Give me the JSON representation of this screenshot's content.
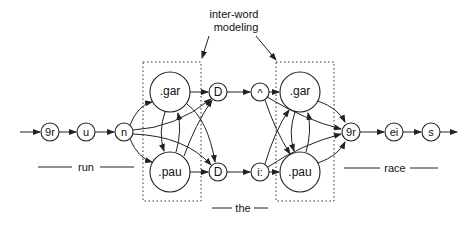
{
  "annotation": {
    "line1": "inter-word",
    "line2": "modeling"
  },
  "words": {
    "run": "run",
    "the": "the",
    "race": "race"
  },
  "nodes": {
    "run_g": "9r",
    "run_u": "u",
    "run_n": "n",
    "left_gar": ".gar",
    "left_pau": ".pau",
    "the_D_top": "D",
    "the_D_bottom": "D",
    "the_caret": "^",
    "the_i": "i:",
    "right_gar": ".gar",
    "right_pau": ".pau",
    "race_g": "9r",
    "race_ei": "ei",
    "race_s": "s"
  }
}
